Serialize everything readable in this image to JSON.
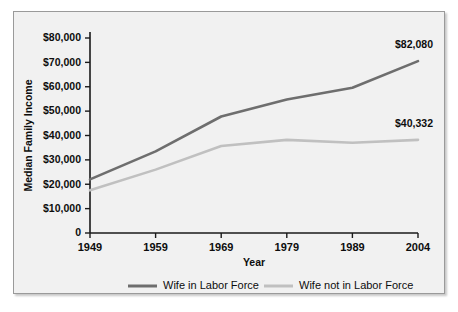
{
  "chart_data": {
    "type": "line",
    "title": "",
    "xlabel": "Year",
    "ylabel": "Median Family Income",
    "categories": [
      "1949",
      "1959",
      "1969",
      "1979",
      "1989",
      "2004"
    ],
    "ylim": [
      0,
      80000
    ],
    "ytick_values": [
      0,
      10000,
      20000,
      30000,
      40000,
      50000,
      60000,
      70000,
      80000
    ],
    "ytick_labels": [
      "0",
      "$10,000",
      "$20,000",
      "$30,000",
      "$40,000",
      "$50,000",
      "$60,000",
      "$70,000",
      "$80,000"
    ],
    "grid": false,
    "legend_position": "bottom",
    "series": [
      {
        "name": "Wife in Labor Force",
        "color": "#6e6e6e",
        "values": [
          22000,
          33500,
          47800,
          54800,
          59600,
          70500
        ],
        "end_label": "$82,080"
      },
      {
        "name": "Wife not in Labor Force",
        "color": "#c0c0c0",
        "values": [
          17500,
          26000,
          35700,
          38200,
          37000,
          38200
        ],
        "end_label": "$40,332"
      }
    ],
    "annotations": [
      {
        "text": "$82,080",
        "series": "Wife in Labor Force",
        "at": "2004"
      },
      {
        "text": "$40,332",
        "series": "Wife not in Labor Force",
        "at": "2004"
      }
    ]
  },
  "legend": {
    "items": [
      {
        "label": "Wife in Labor Force",
        "color": "#6e6e6e"
      },
      {
        "label": "Wife not in Labor Force",
        "color": "#c0c0c0"
      }
    ]
  }
}
